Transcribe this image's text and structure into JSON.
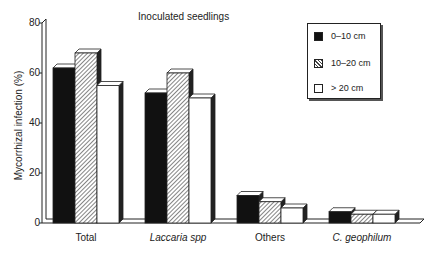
{
  "chart_data": {
    "type": "bar",
    "title": "Inoculated seedlings",
    "xlabel": "",
    "ylabel": "Mycorrhizal infection (%)",
    "ylim": [
      0,
      80
    ],
    "yticks": [
      0,
      20,
      40,
      60,
      80
    ],
    "grid": false,
    "legend_position": "top-right",
    "style": "3d bars",
    "categories": [
      "Total",
      "Laccaria spp",
      "Others",
      "C. geophilum"
    ],
    "categories_italic": [
      false,
      true,
      false,
      true
    ],
    "series": [
      {
        "name": "0–10 cm",
        "fill": "solid-black",
        "values": [
          62,
          52,
          11,
          4.5
        ]
      },
      {
        "name": "10–20 cm",
        "fill": "hatched",
        "values": [
          68,
          60,
          8.5,
          3.5
        ]
      },
      {
        "name": "> 20 cm",
        "fill": "white",
        "values": [
          55,
          50,
          6,
          3.5
        ]
      }
    ]
  }
}
